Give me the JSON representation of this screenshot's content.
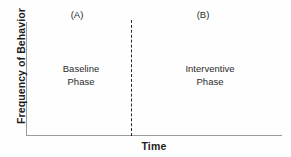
{
  "figure": {
    "background_color": "#fefefe",
    "axis_color": "#9a9a9a",
    "divider_color": "#2a2a2a",
    "text_color": "#2b2b2b"
  },
  "axes": {
    "y_label": "Frequency of Behavior",
    "x_label": "Time"
  },
  "phases": [
    {
      "header": "(A)",
      "name_line_1": "Baseline",
      "name_line_2": "Phase"
    },
    {
      "header": "(B)",
      "name_line_1": "Interventive",
      "name_line_2": "Phase"
    }
  ],
  "chart_data": {
    "type": "line",
    "title": "",
    "subtitle": "",
    "xlabel": "Time",
    "ylabel": "Frequency of Behavior",
    "grid": false,
    "legend": "none",
    "axis_ticks": {
      "x": [],
      "y": []
    },
    "series": [],
    "annotations": [
      {
        "label": "(A)",
        "text": "Baseline Phase",
        "region": "left",
        "x_fraction_start": 0.0,
        "x_fraction_end": 0.41
      },
      {
        "label": "(B)",
        "text": "Interventive Phase",
        "region": "right",
        "x_fraction_start": 0.41,
        "x_fraction_end": 1.0
      }
    ],
    "phase_divider": {
      "style": "dashed",
      "orientation": "vertical",
      "x_fraction": 0.41
    }
  }
}
